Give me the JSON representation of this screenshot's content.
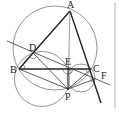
{
  "figure": {
    "type": "geometry-diagram",
    "points": {
      "A": {
        "label": "A",
        "x": 70,
        "y": 11
      },
      "B": {
        "label": "B",
        "x": 19,
        "y": 69
      },
      "C": {
        "label": "C",
        "x": 91,
        "y": 69
      },
      "D": {
        "label": "D",
        "x": 33,
        "y": 53
      },
      "E": {
        "label": "E",
        "x": 68,
        "y": 69
      },
      "F": {
        "label": "F",
        "x": 95,
        "y": 79
      },
      "P": {
        "label": "P",
        "x": 68,
        "y": 89
      }
    },
    "circles": [
      {
        "name": "circumcircle-ABC",
        "cx": 55,
        "cy": 48,
        "r": 42
      },
      {
        "name": "circle-BDEP",
        "cx": 42,
        "cy": 79,
        "r": 27.5
      },
      {
        "name": "circle-ECFP",
        "cx": 81,
        "cy": 78,
        "r": 14
      }
    ],
    "colors": {
      "line": "#222222",
      "circle": "#666666",
      "divider": "#c8c8c8",
      "background": "#ffffff"
    }
  }
}
